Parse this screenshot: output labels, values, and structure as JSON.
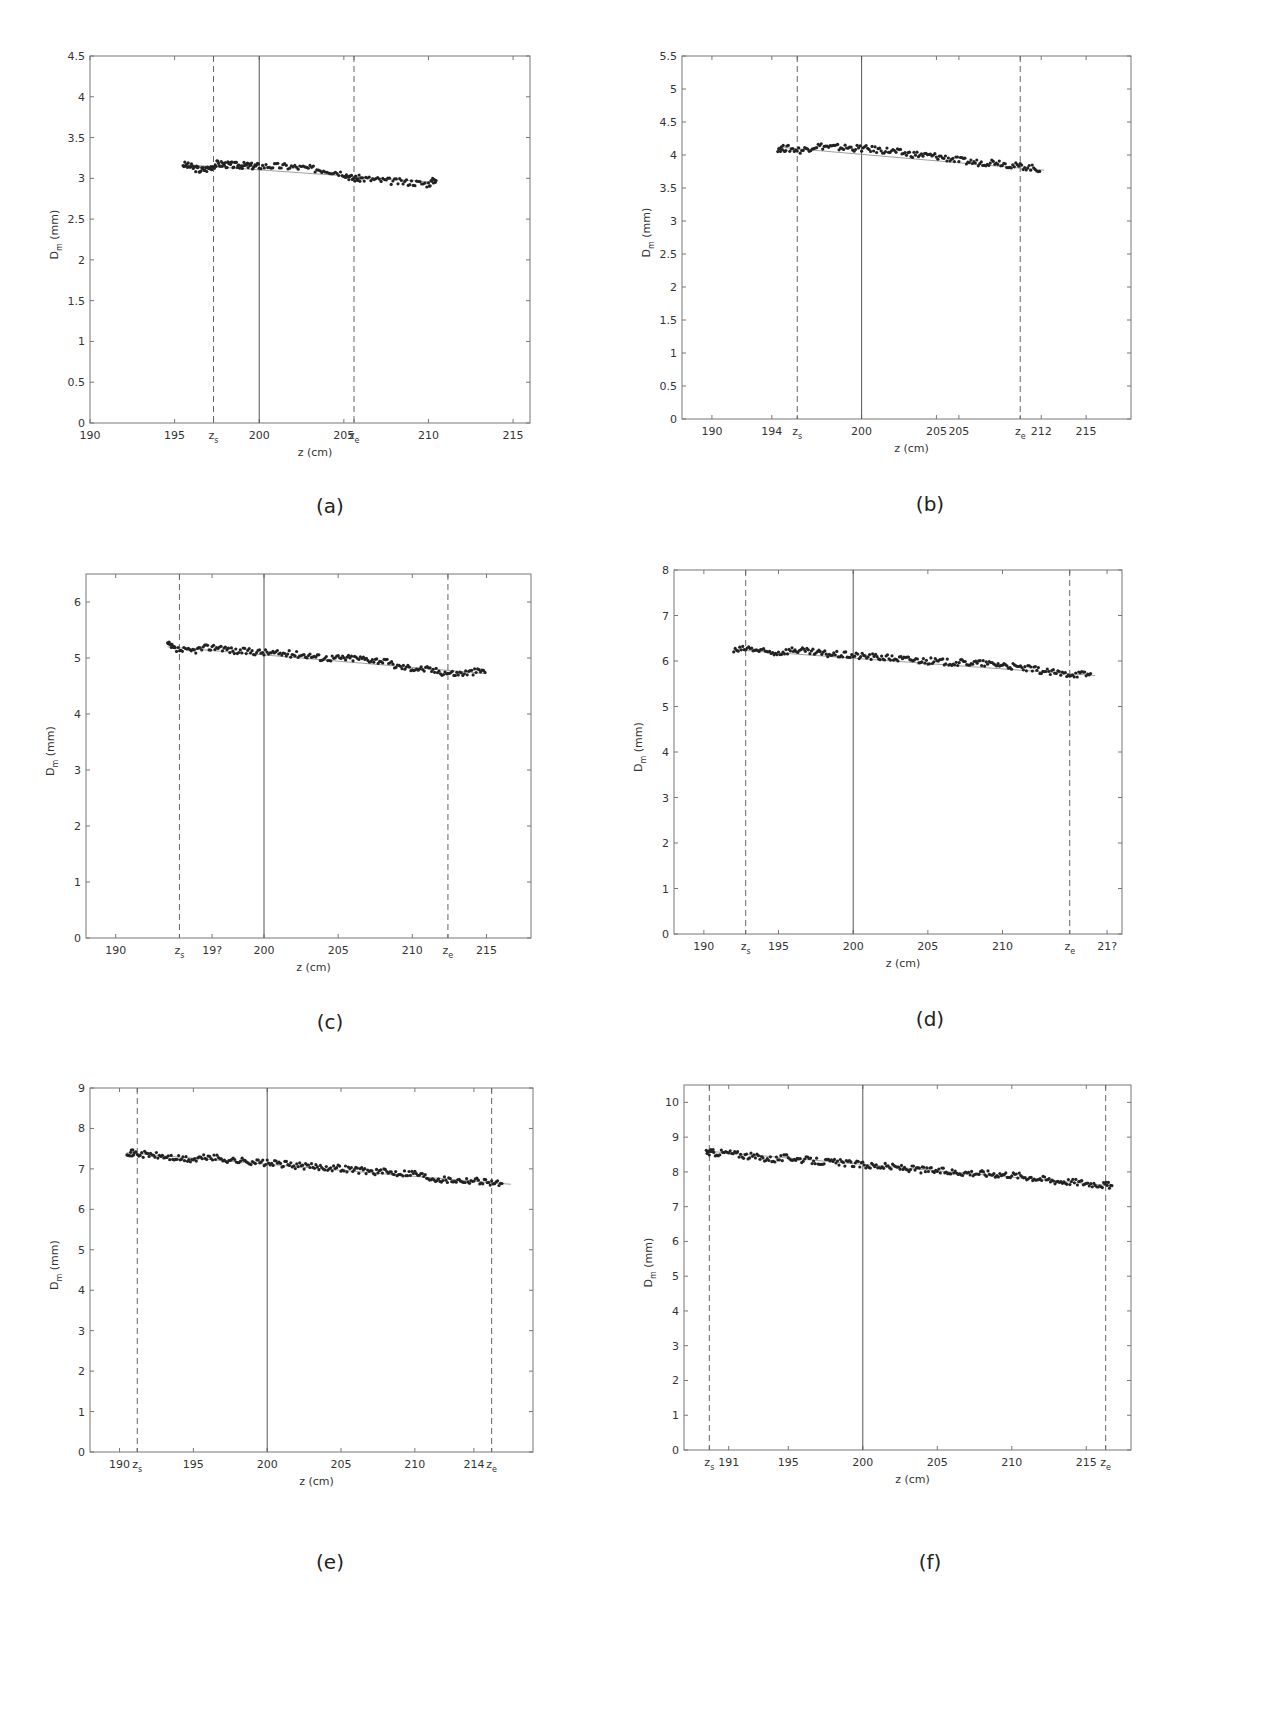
{
  "figure": {
    "panels": [
      {
        "id": "a",
        "caption": "(a)"
      },
      {
        "id": "b",
        "caption": "(b)"
      },
      {
        "id": "c",
        "caption": "(c)"
      },
      {
        "id": "d",
        "caption": "(d)"
      },
      {
        "id": "e",
        "caption": "(e)"
      },
      {
        "id": "f",
        "caption": "(f)"
      }
    ],
    "xlabel": "z  (cm)",
    "ylabel": "D_m (mm)"
  },
  "chart_data": [
    {
      "type": "scatter",
      "panel": "a",
      "title": "(a)",
      "xlabel": "z (cm)",
      "ylabel": "D_m (mm)",
      "xlim": [
        190,
        216
      ],
      "ylim": [
        0,
        4.5
      ],
      "xticks": [
        "190",
        "195",
        "z_s",
        "200",
        "205",
        "z_e",
        "210",
        "215"
      ],
      "yticks": [
        "0",
        "0.5",
        "1",
        "1.5",
        "2",
        "2.5",
        "3",
        "3.5",
        "4",
        "4.5"
      ],
      "z_s": 197.3,
      "z_e": 205.6,
      "center_line": 200,
      "trend": {
        "x": [
          195.5,
          210.5
        ],
        "y": [
          3.17,
          2.95
        ]
      },
      "series": [
        {
          "name": "D_m",
          "x": [
            195.5,
            196,
            196.5,
            197,
            197.5,
            198,
            198.5,
            199,
            199.5,
            200,
            201,
            202,
            203,
            204,
            205,
            205.5,
            206,
            207,
            208,
            209,
            210,
            210.5
          ],
          "values": [
            3.17,
            3.14,
            3.1,
            3.12,
            3.18,
            3.17,
            3.16,
            3.16,
            3.15,
            3.15,
            3.15,
            3.14,
            3.12,
            3.1,
            3.06,
            3.0,
            3.0,
            2.98,
            2.96,
            2.95,
            2.93,
            3.0
          ]
        }
      ]
    },
    {
      "type": "scatter",
      "panel": "b",
      "title": "(b)",
      "xlabel": "z (cm)",
      "ylabel": "D_m (mm)",
      "xlim": [
        188,
        218
      ],
      "ylim": [
        0,
        5.5
      ],
      "xticks": [
        "190",
        "194",
        "z_s",
        "200",
        "205",
        "205",
        "z_e",
        "212",
        "215"
      ],
      "yticks": [
        "0",
        "0.5",
        "1",
        "1.5",
        "2",
        "2.5",
        "3",
        "3.5",
        "4",
        "4.5",
        "5",
        "5.5"
      ],
      "z_s": 195.7,
      "z_e": 210.6,
      "center_line": 200,
      "trend": {
        "x": [
          194.4,
          212.2
        ],
        "y": [
          4.12,
          3.77
        ]
      },
      "series": [
        {
          "name": "D_m",
          "x": [
            194.4,
            195,
            196,
            197,
            198,
            199,
            200,
            201,
            202,
            203,
            204,
            205,
            206,
            207,
            208,
            209,
            210,
            211,
            212
          ],
          "values": [
            4.1,
            4.1,
            4.07,
            4.14,
            4.12,
            4.11,
            4.1,
            4.08,
            4.06,
            4.02,
            4.0,
            3.98,
            3.94,
            3.9,
            3.88,
            3.9,
            3.84,
            3.82,
            3.78
          ]
        }
      ]
    },
    {
      "type": "scatter",
      "panel": "c",
      "title": "(c)",
      "xlabel": "z (cm)",
      "ylabel": "D_m (mm)",
      "xlim": [
        188,
        218
      ],
      "ylim": [
        0,
        6.5
      ],
      "xticks": [
        "190",
        "z_s",
        "19?",
        "200",
        "205",
        "210",
        "z_e",
        "215"
      ],
      "yticks": [
        "0",
        "1",
        "2",
        "3",
        "4",
        "5",
        "6"
      ],
      "z_s": 194.3,
      "z_e": 212.4,
      "center_line": 200,
      "trend": {
        "x": [
          193.5,
          215
        ],
        "y": [
          5.2,
          4.72
        ]
      },
      "series": [
        {
          "name": "D_m",
          "x": [
            193.5,
            194,
            195,
            196,
            197,
            198,
            199,
            200,
            201,
            202,
            203,
            204,
            205,
            206,
            207,
            208,
            209,
            210,
            211,
            212,
            213,
            214,
            215
          ],
          "values": [
            5.25,
            5.15,
            5.12,
            5.18,
            5.2,
            5.12,
            5.12,
            5.1,
            5.08,
            5.07,
            5.05,
            5.0,
            5.0,
            5.0,
            4.98,
            4.95,
            4.85,
            4.82,
            4.8,
            4.75,
            4.72,
            4.75,
            4.78
          ]
        }
      ]
    },
    {
      "type": "scatter",
      "panel": "d",
      "title": "(d)",
      "xlabel": "z (cm)",
      "ylabel": "D_m (mm)",
      "xlim": [
        188,
        218
      ],
      "ylim": [
        0,
        8
      ],
      "xticks": [
        "190",
        "z_s",
        "195",
        "200",
        "205",
        "210",
        "z_e",
        "21?"
      ],
      "yticks": [
        "0",
        "1",
        "2",
        "3",
        "4",
        "5",
        "6",
        "7",
        "8"
      ],
      "z_s": 192.8,
      "z_e": 214.5,
      "center_line": 200,
      "trend": {
        "x": [
          192,
          216.2
        ],
        "y": [
          6.25,
          5.68
        ]
      },
      "series": [
        {
          "name": "D_m",
          "x": [
            192,
            193,
            194,
            195,
            196,
            197,
            198,
            199,
            200,
            201,
            202,
            203,
            204,
            205,
            206,
            207,
            208,
            209,
            210,
            211,
            212,
            213,
            214,
            215,
            216
          ],
          "values": [
            6.22,
            6.28,
            6.2,
            6.18,
            6.25,
            6.2,
            6.16,
            6.14,
            6.12,
            6.1,
            6.08,
            6.05,
            6.03,
            6.0,
            5.98,
            5.96,
            5.96,
            5.94,
            5.92,
            5.86,
            5.82,
            5.76,
            5.72,
            5.72,
            5.7
          ]
        }
      ]
    },
    {
      "type": "scatter",
      "panel": "e",
      "title": "(e)",
      "xlabel": "z (cm)",
      "ylabel": "D_m (mm)",
      "xlim": [
        188,
        218
      ],
      "ylim": [
        0,
        9
      ],
      "xticks": [
        "190",
        "z_s",
        "195",
        "200",
        "205",
        "210",
        "214",
        "z_e"
      ],
      "yticks": [
        "0",
        "1",
        "2",
        "3",
        "4",
        "5",
        "6",
        "7",
        "8",
        "9"
      ],
      "z_s": 191.2,
      "z_e": 215.2,
      "center_line": 200,
      "trend": {
        "x": [
          190.5,
          216.5
        ],
        "y": [
          7.4,
          6.62
        ]
      },
      "series": [
        {
          "name": "D_m",
          "x": [
            190.5,
            191,
            192,
            193,
            194,
            195,
            196,
            197,
            198,
            199,
            200,
            201,
            202,
            203,
            204,
            205,
            206,
            207,
            208,
            209,
            210,
            211,
            212,
            213,
            214,
            215,
            216
          ],
          "values": [
            7.42,
            7.38,
            7.35,
            7.3,
            7.25,
            7.22,
            7.3,
            7.24,
            7.2,
            7.18,
            7.14,
            7.12,
            7.08,
            7.05,
            7.04,
            7.02,
            6.98,
            6.94,
            6.92,
            6.9,
            6.9,
            6.78,
            6.74,
            6.72,
            6.72,
            6.68,
            6.62
          ]
        }
      ]
    },
    {
      "type": "scatter",
      "panel": "f",
      "title": "(f)",
      "xlabel": "z (cm)",
      "ylabel": "D_m (mm)",
      "xlim": [
        188,
        218
      ],
      "ylim": [
        0,
        10.5
      ],
      "xticks": [
        "z_s",
        "191",
        "195",
        "200",
        "205",
        "210",
        "215",
        "z_e"
      ],
      "yticks": [
        "0",
        "1",
        "2",
        "3",
        "4",
        "5",
        "6",
        "7",
        "8",
        "9",
        "10"
      ],
      "z_s": 189.7,
      "z_e": 216.3,
      "center_line": 200,
      "trend": {
        "x": [
          189.5,
          216.8
        ],
        "y": [
          8.6,
          7.6
        ]
      },
      "series": [
        {
          "name": "D_m",
          "x": [
            189.5,
            190,
            191,
            192,
            193,
            194,
            195,
            196,
            197,
            198,
            199,
            200,
            201,
            202,
            203,
            204,
            205,
            206,
            207,
            208,
            209,
            210,
            211,
            212,
            213,
            214,
            215,
            216,
            216.8
          ],
          "values": [
            8.58,
            8.55,
            8.55,
            8.48,
            8.42,
            8.36,
            8.42,
            8.35,
            8.3,
            8.28,
            8.25,
            8.2,
            8.17,
            8.14,
            8.1,
            8.06,
            8.03,
            8.0,
            7.98,
            7.96,
            7.94,
            7.92,
            7.86,
            7.8,
            7.74,
            7.72,
            7.68,
            7.64,
            7.6
          ]
        }
      ]
    }
  ]
}
